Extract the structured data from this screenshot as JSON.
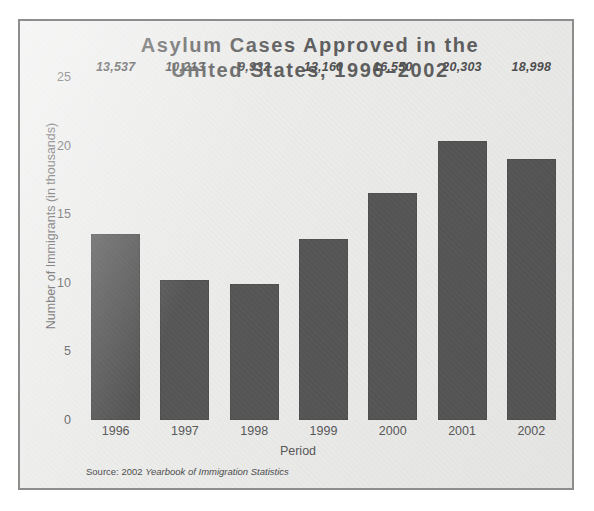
{
  "figure": {
    "background_color": "#ffffff",
    "panel_color": "#ececeb",
    "panel_border_color": "#8d8d8d",
    "bar_color": "#565656",
    "text_color": "#585858"
  },
  "chart_data": {
    "type": "bar",
    "title": "Asylum Cases Approved in the\nUnited States, 1996–2002",
    "xlabel": "Period",
    "ylabel": "Number of Immigrants (in thousands)",
    "categories": [
      "1996",
      "1997",
      "1998",
      "1999",
      "2000",
      "2001",
      "2002"
    ],
    "values": [
      13537,
      10213,
      9932,
      13160,
      16550,
      20303,
      18998
    ],
    "value_labels": [
      "13,537",
      "10,213",
      "9,932",
      "13,160",
      "16,550",
      "20,303",
      "18,998"
    ],
    "ylim": [
      0,
      25
    ],
    "yticks": [
      0,
      5,
      10,
      15,
      20,
      25
    ],
    "ytick_labels": [
      "0",
      "5",
      "10",
      "15",
      "20",
      "25"
    ],
    "units": "thousands",
    "grid": false,
    "legend": false,
    "series": [
      {
        "name": "Asylum cases approved",
        "values": [
          13537,
          10213,
          9932,
          13160,
          16550,
          20303,
          18998
        ]
      }
    ]
  },
  "source_note": {
    "prefix": "Source: 2002 ",
    "italic": "Yearbook of Immigration Statistics"
  }
}
